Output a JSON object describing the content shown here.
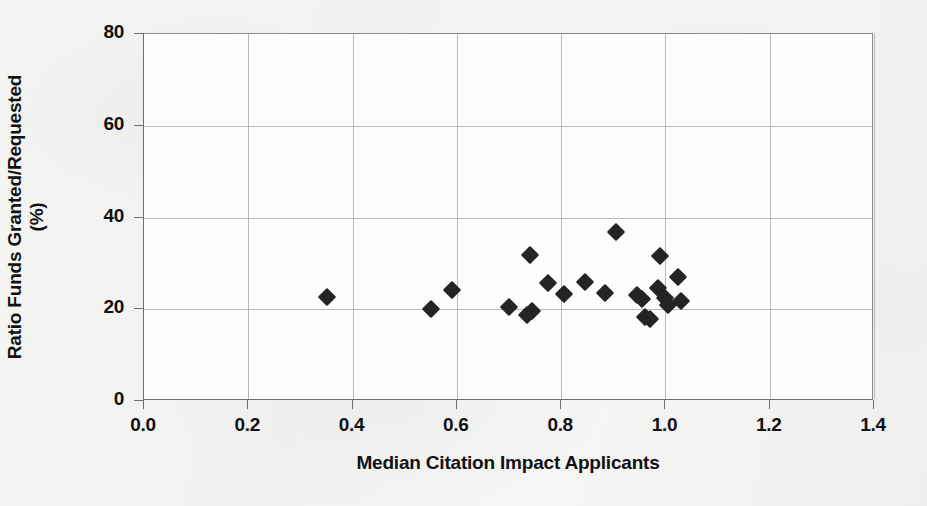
{
  "chart_data": {
    "type": "scatter",
    "title": "",
    "xlabel": "Median Citation Impact Applicants",
    "ylabel": "Ratio Funds Granted/Requested (%)",
    "ylabel_line1": "Ratio Funds Granted/Requested",
    "ylabel_line2": "(%)",
    "xlim": [
      0.0,
      1.4
    ],
    "ylim": [
      0,
      80
    ],
    "xticks": [
      "0.0",
      "0.2",
      "0.4",
      "0.6",
      "0.8",
      "1.0",
      "1.2",
      "1.4"
    ],
    "xtick_values": [
      0.0,
      0.2,
      0.4,
      0.6,
      0.8,
      1.0,
      1.2,
      1.4
    ],
    "yticks": [
      "0",
      "20",
      "40",
      "60",
      "80"
    ],
    "ytick_values": [
      0,
      20,
      40,
      60,
      80
    ],
    "grid": true,
    "legend": "none",
    "marker": "filled-diamond",
    "marker_color": "#242424",
    "plot_background": "#fdfdfc",
    "gridline_color": "#b9b9b9",
    "axis_color": "#6f6f6f",
    "points": [
      {
        "x": 0.35,
        "y": 22.6
      },
      {
        "x": 0.55,
        "y": 20.1
      },
      {
        "x": 0.59,
        "y": 24.2
      },
      {
        "x": 0.7,
        "y": 20.5
      },
      {
        "x": 0.735,
        "y": 18.8
      },
      {
        "x": 0.745,
        "y": 19.6
      },
      {
        "x": 0.74,
        "y": 31.8
      },
      {
        "x": 0.775,
        "y": 25.8
      },
      {
        "x": 0.805,
        "y": 23.4
      },
      {
        "x": 0.845,
        "y": 26.0
      },
      {
        "x": 0.885,
        "y": 23.6
      },
      {
        "x": 0.905,
        "y": 36.8
      },
      {
        "x": 0.945,
        "y": 23.1
      },
      {
        "x": 0.955,
        "y": 22.3
      },
      {
        "x": 0.96,
        "y": 18.3
      },
      {
        "x": 0.97,
        "y": 17.9
      },
      {
        "x": 0.985,
        "y": 24.6
      },
      {
        "x": 0.99,
        "y": 31.5
      },
      {
        "x": 1.0,
        "y": 22.4
      },
      {
        "x": 1.005,
        "y": 20.9
      },
      {
        "x": 1.025,
        "y": 27.0
      },
      {
        "x": 1.03,
        "y": 21.7
      }
    ]
  }
}
